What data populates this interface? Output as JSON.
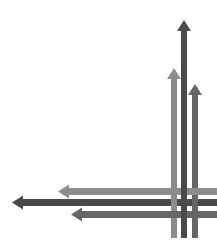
{
  "diagram": {
    "colors": {
      "light": "#8c8c8c",
      "dark": "#4a4a4a",
      "medium": "#666666",
      "background": "#ffffff"
    },
    "vertical_arrows": [
      {
        "name": "up-arrow-light",
        "x": 174,
        "top": 68,
        "bottom": 238,
        "width": 6,
        "color": "#8c8c8c"
      },
      {
        "name": "up-arrow-dark",
        "x": 184,
        "top": 20,
        "bottom": 238,
        "width": 6,
        "color": "#4a4a4a"
      },
      {
        "name": "up-arrow-medium",
        "x": 195,
        "top": 84,
        "bottom": 238,
        "width": 6,
        "color": "#666666"
      }
    ],
    "horizontal_arrows": [
      {
        "name": "left-arrow-light",
        "y": 191.5,
        "left": 58,
        "right": 217,
        "width": 7,
        "color": "#8c8c8c"
      },
      {
        "name": "left-arrow-dark",
        "y": 202.5,
        "left": 12,
        "right": 217,
        "width": 7,
        "color": "#4a4a4a"
      },
      {
        "name": "left-arrow-medium",
        "y": 214.5,
        "left": 71,
        "right": 217,
        "width": 7,
        "color": "#666666"
      }
    ]
  }
}
